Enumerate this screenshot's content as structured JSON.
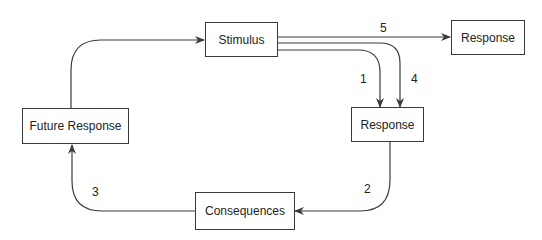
{
  "diagram": {
    "nodes": {
      "stimulus": "Stimulus",
      "response_top": "Response",
      "response_mid": "Response",
      "future_response": "Future Response",
      "consequences": "Consequences"
    },
    "edges": [
      {
        "id": "1",
        "from": "Stimulus",
        "to": "Response (mid)",
        "label": "1"
      },
      {
        "id": "2",
        "from": "Response (mid)",
        "to": "Consequences",
        "label": "2"
      },
      {
        "id": "3",
        "from": "Consequences",
        "to": "Future Response",
        "label": "3"
      },
      {
        "id": "4",
        "from": "Stimulus",
        "to": "Response (mid)",
        "label": "4"
      },
      {
        "id": "5",
        "from": "Stimulus",
        "to": "Response (top)",
        "label": "5"
      },
      {
        "id": "loop",
        "from": "Future Response",
        "to": "Stimulus",
        "label": ""
      }
    ],
    "edge_labels": {
      "e1": "1",
      "e2": "2",
      "e3": "3",
      "e4": "4",
      "e5": "5"
    },
    "stroke_color": "#3a3a3a"
  }
}
